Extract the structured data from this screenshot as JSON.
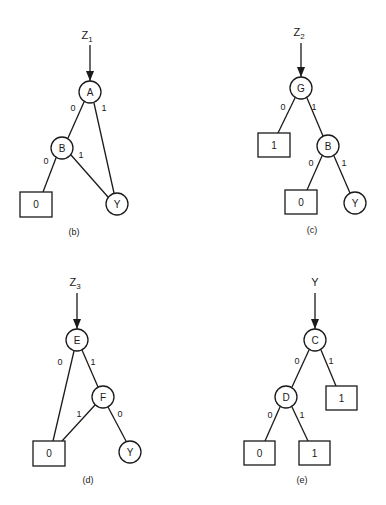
{
  "diagrams": [
    {
      "id": "b",
      "caption": "(b)",
      "root_label": "Z",
      "root_sub": "1",
      "nodes": {
        "A": "A",
        "B": "B",
        "Y": "Y"
      },
      "terminals": {
        "t0": "0"
      },
      "edges": {
        "A_B": "0",
        "A_Y": "1",
        "B_t0": "0",
        "B_Y": "1"
      }
    },
    {
      "id": "c",
      "caption": "(c)",
      "root_label": "Z",
      "root_sub": "2",
      "nodes": {
        "G": "G",
        "B": "B",
        "Y": "Y"
      },
      "terminals": {
        "t1": "1",
        "t0": "0"
      },
      "edges": {
        "G_t1": "0",
        "G_B": "1",
        "B_t0": "0",
        "B_Y": "1"
      }
    },
    {
      "id": "d",
      "caption": "(d)",
      "root_label": "Z",
      "root_sub": "3",
      "nodes": {
        "E": "E",
        "F": "F",
        "Y": "Y"
      },
      "terminals": {
        "t0": "0"
      },
      "edges": {
        "E_t0": "0",
        "E_F": "1",
        "F_t0": "1",
        "F_Y": "0"
      }
    },
    {
      "id": "e",
      "caption": "(e)",
      "root_label": "Y",
      "root_sub": "",
      "nodes": {
        "C": "C",
        "D": "D"
      },
      "terminals": {
        "t1a": "1",
        "t0": "0",
        "t1b": "1"
      },
      "edges": {
        "C_D": "0",
        "C_t1": "1",
        "D_t0": "0",
        "D_t1": "1"
      }
    }
  ]
}
